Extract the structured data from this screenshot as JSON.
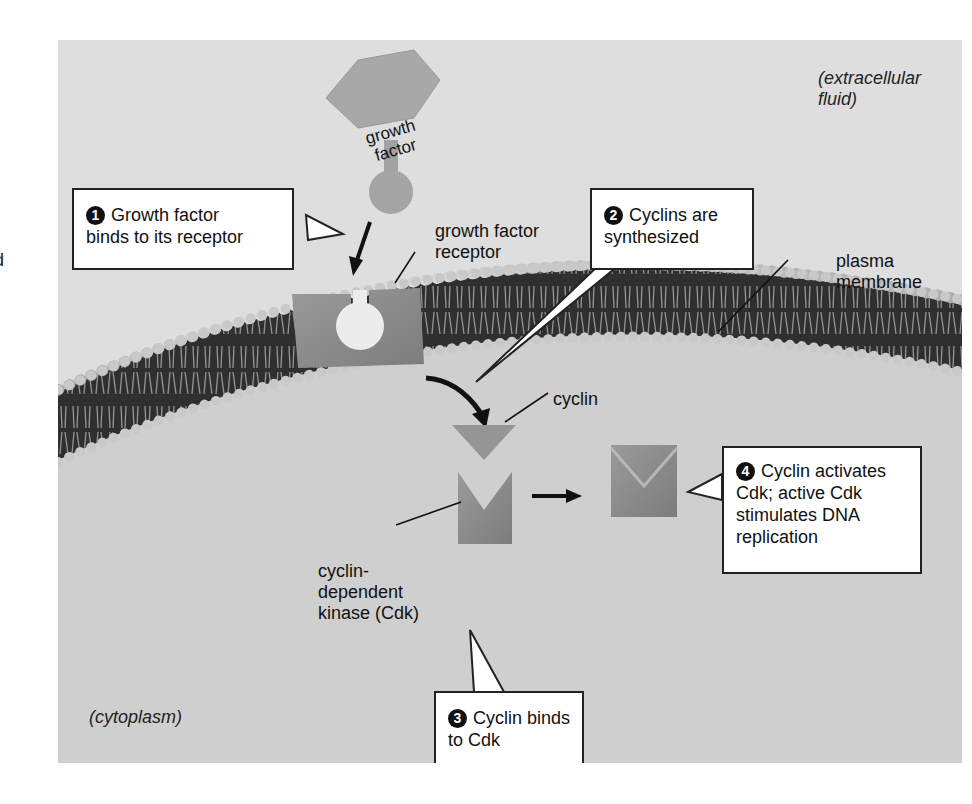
{
  "edge_fragment": "d",
  "regions": {
    "extracellular": [
      "(extracellular",
      "fluid)"
    ],
    "cytoplasm": "(cytoplasm)"
  },
  "molecules": {
    "growth_factor": [
      "growth",
      "factor"
    ],
    "growth_factor_receptor": [
      "growth factor",
      "receptor"
    ],
    "plasma_membrane": [
      "plasma",
      "membrane"
    ],
    "cyclin": "cyclin",
    "cdk": [
      "cyclin-",
      "dependent",
      "kinase (Cdk)"
    ]
  },
  "steps": [
    {
      "number": "1",
      "lines": [
        "Growth factor",
        "binds to its receptor"
      ]
    },
    {
      "number": "2",
      "lines": [
        "Cyclins are",
        "synthesized"
      ]
    },
    {
      "number": "3",
      "lines": [
        "Cyclin binds",
        "to Cdk"
      ]
    },
    {
      "number": "4",
      "lines": [
        "Cyclin activates",
        "Cdk; active Cdk",
        "stimulates DNA",
        "replication"
      ]
    }
  ],
  "colors": {
    "panel_bg": "#dedede",
    "cytoplasm_bg": "#cdcdcd",
    "protein_gray": "#8e8e8e",
    "membrane_dark": "#2a2a2a",
    "lipid_head": "#c8c8c8"
  }
}
